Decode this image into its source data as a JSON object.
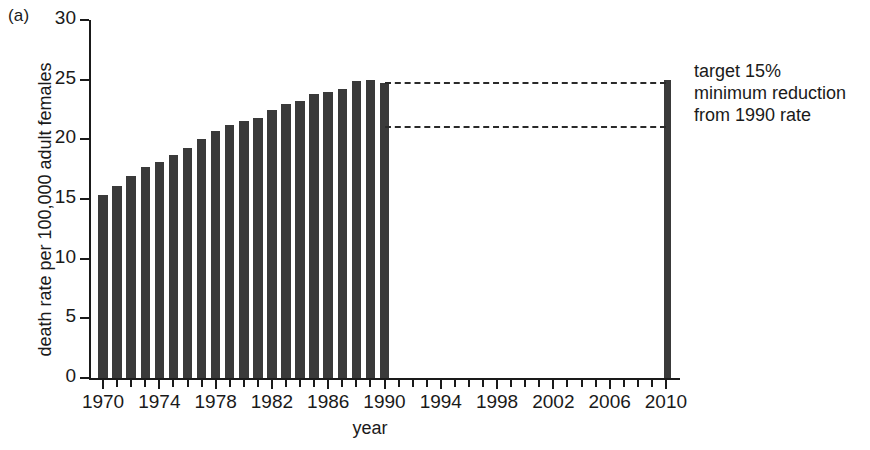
{
  "panel": {
    "tag": "(a)"
  },
  "chart_data": {
    "type": "bar",
    "title": "",
    "panel_label": "(a)",
    "xlabel": "year",
    "ylabel": "death rate per 100,000 adult females",
    "ylim": [
      0,
      30
    ],
    "xlim": [
      1969,
      2011
    ],
    "yticks": [
      0,
      5,
      10,
      15,
      20,
      25,
      30
    ],
    "ytick_labels": [
      "0",
      "5",
      "10",
      "15",
      "20",
      "25",
      "30"
    ],
    "xticks": [
      1970,
      1974,
      1978,
      1982,
      1986,
      1990,
      1994,
      1998,
      2002,
      2006,
      2010
    ],
    "xtick_labels": [
      "1970",
      "1974",
      "1978",
      "1982",
      "1986",
      "1990",
      "1994",
      "1998",
      "2002",
      "2006",
      "2010"
    ],
    "xtick_minor_step": 1,
    "grid": false,
    "legend": false,
    "bar_color": "#3a3a3a",
    "categories": [
      1970,
      1971,
      1972,
      1973,
      1974,
      1975,
      1976,
      1977,
      1978,
      1979,
      1980,
      1981,
      1982,
      1983,
      1984,
      1985,
      1986,
      1987,
      1988,
      1989,
      1990,
      2010
    ],
    "values": [
      15.3,
      16.1,
      16.9,
      17.7,
      18.1,
      18.7,
      19.3,
      20.0,
      20.7,
      21.2,
      21.5,
      21.8,
      22.5,
      23.0,
      23.2,
      23.8,
      24.0,
      24.2,
      24.9,
      25.0,
      24.7,
      25.0
    ],
    "annotations": [
      {
        "name": "target-note",
        "lines": [
          "target 15%",
          "minimum reduction",
          "from 1990 rate"
        ],
        "x": 2011,
        "y": 25.5
      }
    ],
    "reference_lines": [
      {
        "name": "rate-1990-line",
        "y": 24.7,
        "x_from": 1990,
        "x_to": 2010,
        "style": "dashed"
      },
      {
        "name": "target-15pct-line",
        "y": 21.0,
        "x_from": 1990,
        "x_to": 2010,
        "style": "dashed"
      }
    ]
  },
  "annotation": {
    "line1": "target 15%",
    "line2": "minimum reduction",
    "line3": "from 1990 rate"
  },
  "axis": {
    "x_title": "year",
    "y_title": "death rate per 100,000 adult females"
  }
}
